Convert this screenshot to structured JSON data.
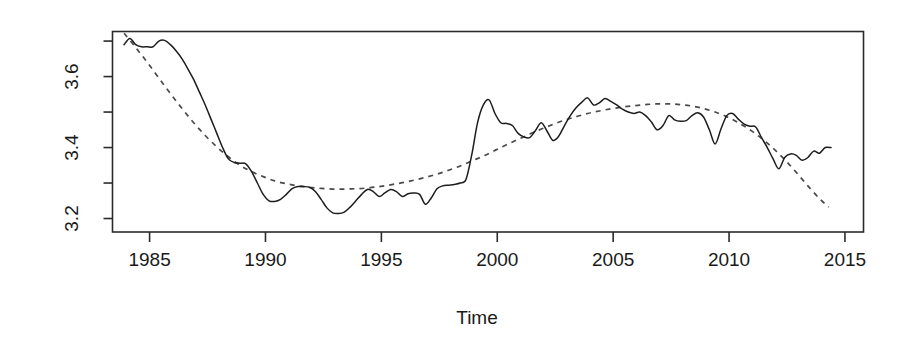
{
  "figure": {
    "background_color": "#ffffff",
    "foreground_color": "#1a1a1a"
  },
  "axis_titles": {
    "x": "Time",
    "y": ""
  },
  "x_tick_labels": [
    "1985",
    "1990",
    "1995",
    "2000",
    "2005",
    "2010",
    "2015"
  ],
  "y_tick_labels": [
    "3.2",
    "3.4",
    "3.6"
  ],
  "chart_data": {
    "type": "line",
    "title": "",
    "subtitle": "",
    "xlabel": "Time",
    "ylabel": "",
    "xlim": [
      1983.4,
      1985.8
    ],
    "ylim": [
      3.162,
      3.727
    ],
    "grid": false,
    "legend": null,
    "x_ticks": [
      1985,
      1990,
      1995,
      2000,
      2005,
      2010,
      2015
    ],
    "x_tick_labels": [
      "1985",
      "1990",
      "1995",
      "2000",
      "2005",
      "2010",
      "2015"
    ],
    "y_ticks": [
      3.2,
      3.3,
      3.4,
      3.5,
      3.6,
      3.7
    ],
    "y_tick_labels": [
      "3.2",
      "",
      "3.4",
      "",
      "3.6",
      ""
    ],
    "y_labeled_ticks": [
      3.2,
      3.4,
      3.6
    ],
    "xlim_actual": [
      1983.4,
      2015.8
    ],
    "series": [
      {
        "name": "observed",
        "style": "solid",
        "color": "#1d1d1d",
        "x": [
          1983.9,
          1984.15,
          1984.4,
          1984.65,
          1984.9,
          1985.15,
          1985.4,
          1985.65,
          1985.9,
          1986.15,
          1986.4,
          1986.65,
          1986.9,
          1987.15,
          1987.4,
          1987.65,
          1987.9,
          1988.15,
          1988.4,
          1988.65,
          1988.9,
          1989.15,
          1989.4,
          1989.65,
          1989.9,
          1990.15,
          1990.4,
          1990.65,
          1990.9,
          1991.15,
          1991.4,
          1991.65,
          1991.9,
          1992.15,
          1992.4,
          1992.65,
          1992.9,
          1993.15,
          1993.4,
          1993.65,
          1993.9,
          1994.15,
          1994.4,
          1994.65,
          1994.9,
          1995.15,
          1995.4,
          1995.65,
          1995.9,
          1996.15,
          1996.4,
          1996.65,
          1996.9,
          1997.15,
          1997.4,
          1997.65,
          1997.9,
          1998.15,
          1998.4,
          1998.65,
          1998.9,
          1999.15,
          1999.4,
          1999.65,
          1999.9,
          2000.15,
          2000.4,
          2000.65,
          2000.9,
          2001.15,
          2001.4,
          2001.65,
          2001.9,
          2002.15,
          2002.4,
          2002.65,
          2002.9,
          2003.15,
          2003.4,
          2003.65,
          2003.9,
          2004.15,
          2004.4,
          2004.65,
          2004.9,
          2005.15,
          2005.4,
          2005.65,
          2005.9,
          2006.15,
          2006.4,
          2006.65,
          2006.9,
          2007.15,
          2007.4,
          2007.65,
          2007.9,
          2008.15,
          2008.4,
          2008.65,
          2008.9,
          2009.15,
          2009.4,
          2009.65,
          2009.9,
          2010.15,
          2010.4,
          2010.65,
          2010.9,
          2011.15,
          2011.4,
          2011.65,
          2011.9,
          2012.15,
          2012.4,
          2012.65,
          2012.9,
          2013.15,
          2013.4,
          2013.65,
          2013.9,
          2014.15,
          2014.4
        ],
        "y": [
          3.69,
          3.707,
          3.69,
          3.684,
          3.684,
          3.684,
          3.7,
          3.702,
          3.69,
          3.672,
          3.65,
          3.622,
          3.592,
          3.556,
          3.52,
          3.48,
          3.44,
          3.4,
          3.368,
          3.358,
          3.356,
          3.354,
          3.332,
          3.3,
          3.268,
          3.25,
          3.248,
          3.254,
          3.268,
          3.284,
          3.29,
          3.29,
          3.288,
          3.276,
          3.254,
          3.23,
          3.216,
          3.214,
          3.218,
          3.232,
          3.25,
          3.268,
          3.282,
          3.276,
          3.262,
          3.272,
          3.282,
          3.276,
          3.262,
          3.27,
          3.272,
          3.268,
          3.24,
          3.258,
          3.284,
          3.292,
          3.294,
          3.296,
          3.3,
          3.31,
          3.38,
          3.47,
          3.52,
          3.534,
          3.496,
          3.47,
          3.468,
          3.462,
          3.44,
          3.43,
          3.428,
          3.448,
          3.47,
          3.446,
          3.42,
          3.432,
          3.462,
          3.49,
          3.512,
          3.528,
          3.54,
          3.52,
          3.526,
          3.538,
          3.53,
          3.52,
          3.508,
          3.5,
          3.496,
          3.5,
          3.49,
          3.472,
          3.45,
          3.462,
          3.49,
          3.478,
          3.474,
          3.476,
          3.49,
          3.498,
          3.486,
          3.45,
          3.41,
          3.452,
          3.49,
          3.496,
          3.48,
          3.466,
          3.46,
          3.458,
          3.428,
          3.4,
          3.368,
          3.34,
          3.372,
          3.382,
          3.378,
          3.364,
          3.372,
          3.39,
          3.384,
          3.4,
          3.4
        ]
      },
      {
        "name": "trend",
        "style": "dashed",
        "color": "#4a4a4a",
        "x": [
          1983.9,
          1984.4,
          1984.9,
          1985.4,
          1985.9,
          1986.4,
          1986.9,
          1987.4,
          1987.9,
          1988.4,
          1988.9,
          1989.4,
          1989.9,
          1990.4,
          1990.9,
          1991.4,
          1991.9,
          1992.4,
          1992.9,
          1993.4,
          1993.9,
          1994.4,
          1994.9,
          1995.4,
          1995.9,
          1996.4,
          1996.9,
          1997.4,
          1997.9,
          1998.4,
          1998.9,
          1999.4,
          1999.9,
          2000.4,
          2000.9,
          2001.4,
          2001.9,
          2002.4,
          2002.9,
          2003.4,
          2003.9,
          2004.4,
          2004.9,
          2005.4,
          2005.9,
          2006.4,
          2006.9,
          2007.4,
          2007.9,
          2008.4,
          2008.9,
          2009.4,
          2009.9,
          2010.4,
          2010.9,
          2011.4,
          2011.9,
          2012.4,
          2012.9,
          2013.4,
          2013.9,
          2014.3
        ],
        "y": [
          3.722,
          3.682,
          3.64,
          3.596,
          3.552,
          3.51,
          3.47,
          3.434,
          3.402,
          3.374,
          3.35,
          3.332,
          3.318,
          3.306,
          3.298,
          3.292,
          3.288,
          3.285,
          3.283,
          3.283,
          3.284,
          3.286,
          3.29,
          3.295,
          3.301,
          3.308,
          3.316,
          3.325,
          3.336,
          3.348,
          3.362,
          3.376,
          3.392,
          3.408,
          3.423,
          3.438,
          3.452,
          3.465,
          3.477,
          3.487,
          3.496,
          3.503,
          3.509,
          3.514,
          3.518,
          3.521,
          3.523,
          3.523,
          3.521,
          3.517,
          3.51,
          3.5,
          3.487,
          3.47,
          3.45,
          3.426,
          3.398,
          3.366,
          3.33,
          3.292,
          3.256,
          3.232
        ]
      }
    ]
  }
}
